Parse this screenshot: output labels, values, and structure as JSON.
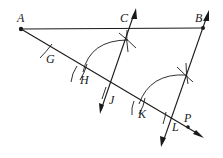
{
  "diagram": {
    "type": "geometric-construction",
    "labels": {
      "A": "A",
      "B": "B",
      "C": "C",
      "G": "G",
      "H": "H",
      "J": "J",
      "K": "K",
      "L": "L",
      "P": "P"
    },
    "points": {
      "A": [
        21,
        29
      ],
      "B": [
        203,
        28
      ],
      "G": [
        51,
        51
      ],
      "H": [
        82,
        73
      ],
      "J": [
        111,
        93
      ],
      "K": [
        141,
        108
      ],
      "L": [
        171,
        118
      ],
      "P": [
        187,
        127
      ]
    },
    "colors": {
      "stroke": "#1a1a1a",
      "background": "#ffffff"
    }
  }
}
